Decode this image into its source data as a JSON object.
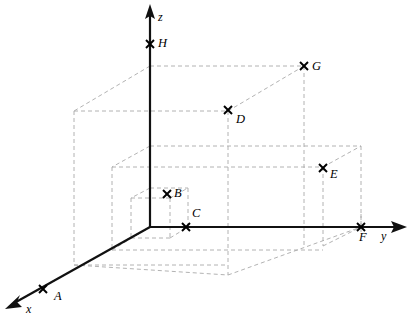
{
  "figure": {
    "type": "3d-coordinate-diagram",
    "title": "",
    "width": 411,
    "height": 323,
    "background": "#ffffff",
    "axis_color": "#111111",
    "dashed_color": "#a9a9a9",
    "marker_color": "#000000",
    "marker_glyph": "x-cross"
  },
  "axes": [
    {
      "name": "x",
      "label": "x",
      "label_x": 26,
      "label_y": 304,
      "origin_x": 150,
      "origin_y": 227,
      "tip_x": 6,
      "tip_y": 307
    },
    {
      "name": "y",
      "label": "y",
      "label_x": 381,
      "label_y": 229,
      "origin_x": 150,
      "origin_y": 227,
      "tip_x": 406,
      "tip_y": 227
    },
    {
      "name": "z",
      "label": "z",
      "label_x": 158,
      "label_y": 10,
      "origin_x": 150,
      "origin_y": 227,
      "tip_x": 150,
      "tip_y": 6
    }
  ],
  "points": [
    {
      "name": "A",
      "label": "A",
      "x": 43,
      "y": 289,
      "label_x": 54,
      "label_y": 290
    },
    {
      "name": "B",
      "label": "B",
      "x": 167,
      "y": 194,
      "label_x": 174,
      "label_y": 192
    },
    {
      "name": "C",
      "label": "C",
      "x": 186,
      "y": 227,
      "label_x": 192,
      "label_y": 210
    },
    {
      "name": "D",
      "label": "D",
      "x": 228,
      "y": 110,
      "label_x": 236,
      "label_y": 113
    },
    {
      "name": "E",
      "label": "E",
      "x": 323,
      "y": 168,
      "label_x": 330,
      "label_y": 171
    },
    {
      "name": "F",
      "label": "F",
      "x": 361,
      "y": 227,
      "label_x": 359,
      "label_y": 231
    },
    {
      "name": "G",
      "label": "G",
      "x": 304,
      "y": 66,
      "label_x": 312,
      "label_y": 62
    },
    {
      "name": "H",
      "label": "H",
      "x": 150,
      "y": 44,
      "label_x": 158,
      "label_y": 39
    }
  ],
  "construction_lines": {
    "description": "dashed projection boxes for points B, D, E, G",
    "count": 34
  }
}
